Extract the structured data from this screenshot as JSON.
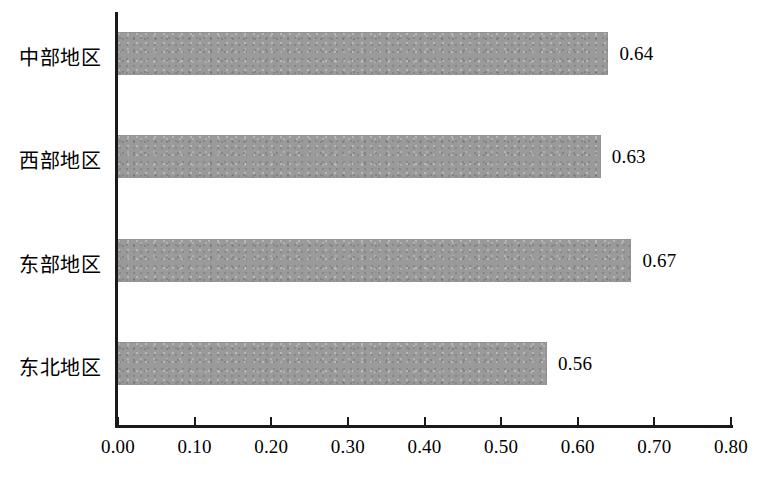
{
  "chart_data": {
    "type": "bar",
    "orientation": "horizontal",
    "title": "",
    "subtitle": "",
    "xlabel": "",
    "ylabel": "",
    "categories": [
      "中部地区",
      "西部地区",
      "东部地区",
      "东北地区"
    ],
    "values": [
      0.64,
      0.63,
      0.67,
      0.56
    ],
    "value_labels": [
      "0.64",
      "0.63",
      "0.67",
      "0.56"
    ],
    "xlim": [
      0.0,
      0.8
    ],
    "xticks": [
      0.0,
      0.1,
      0.2,
      0.3,
      0.4,
      0.5,
      0.6,
      0.7,
      0.8
    ],
    "xtick_labels": [
      "0.00",
      "0.10",
      "0.20",
      "0.30",
      "0.40",
      "0.50",
      "0.60",
      "0.70",
      "0.80"
    ],
    "grid": false,
    "legend": null,
    "legend_position": "none",
    "bar_color": "#9a9a9a",
    "axis_color": "#1a1a1a",
    "text_color": "#000000",
    "background": "#ffffff"
  }
}
